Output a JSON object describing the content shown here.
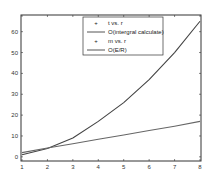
{
  "chart_data": {
    "type": "line",
    "title": "",
    "xlabel": "",
    "ylabel": "",
    "xlim": [
      1,
      8
    ],
    "ylim": [
      -2,
      68
    ],
    "grid": false,
    "legend_position": "upper center",
    "x_ticks": [
      1,
      2,
      3,
      4,
      5,
      6,
      7,
      8
    ],
    "y_ticks": [
      0,
      10,
      20,
      30,
      40,
      50,
      60
    ],
    "x_tick_labels": [
      "1",
      "2",
      "3",
      "4",
      "5",
      "6",
      "7",
      "8"
    ],
    "y_tick_labels": [
      "0",
      "10",
      "20",
      "30",
      "40",
      "50",
      "60"
    ],
    "legend": [
      {
        "label": "t vs. r",
        "style": "marker"
      },
      {
        "label": "O(intergral calculate)",
        "style": "line"
      },
      {
        "label": "m vs. r",
        "style": "marker"
      },
      {
        "label": "O(E/R)",
        "style": "line"
      }
    ],
    "series": [
      {
        "name": "O(intergral calculate)",
        "x": [
          1,
          2,
          3,
          4,
          5,
          6,
          7,
          8
        ],
        "values": [
          1,
          4,
          9,
          17,
          26,
          37,
          50,
          65
        ],
        "color": "#444444"
      },
      {
        "name": "O(E/R)",
        "x": [
          1,
          2,
          3,
          4,
          5,
          6,
          7,
          8
        ],
        "values": [
          2,
          4.2,
          6.3,
          8.4,
          10.5,
          12.6,
          14.7,
          17
        ],
        "color": "#666666"
      }
    ]
  }
}
